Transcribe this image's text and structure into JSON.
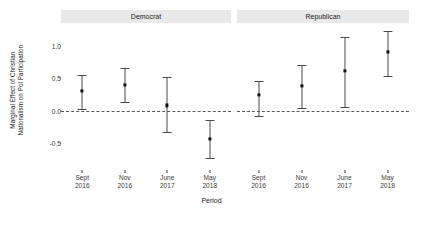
{
  "chart_data": {
    "type": "scatter",
    "title": "",
    "xlabel": "Period",
    "ylabel_line1": "Marginal Effect of Christian",
    "ylabel_line2": "Nationalism on Pol Participation",
    "categories": [
      "Sept 2016",
      "Nov 2016",
      "June 2017",
      "May 2018"
    ],
    "category_labels": [
      {
        "line1": "Sept",
        "line2": "2016"
      },
      {
        "line1": "Nov",
        "line2": "2016"
      },
      {
        "line1": "June",
        "line2": "2017"
      },
      {
        "line1": "May",
        "line2": "2018"
      }
    ],
    "ylim": [
      -0.85,
      1.3
    ],
    "yticks": [
      1.0,
      0.5,
      0.0,
      -0.5
    ],
    "ytick_labels": [
      "1.0",
      "0.5",
      "0.0",
      "-0.5"
    ],
    "grid": false,
    "legend": "none",
    "reference_line": {
      "y": 0.0,
      "style": "dashed",
      "color": "#5a5a5a"
    },
    "facet_labels": [
      "Democrat",
      "Republican"
    ],
    "point_color": "#111111",
    "errorbar_color": "#4a4a4a",
    "strip_background": "#e9e9e9",
    "series": [
      {
        "name": "Democrat",
        "values": [
          0.3,
          0.4,
          0.08,
          -0.43
        ],
        "ci_low": [
          0.03,
          0.13,
          -0.33,
          -0.73
        ],
        "ci_high": [
          0.55,
          0.66,
          0.51,
          -0.14
        ]
      },
      {
        "name": "Republican",
        "values": [
          0.24,
          0.38,
          0.61,
          0.9
        ],
        "ci_low": [
          -0.08,
          0.04,
          0.06,
          0.53
        ],
        "ci_high": [
          0.45,
          0.7,
          1.13,
          1.22
        ]
      }
    ]
  }
}
